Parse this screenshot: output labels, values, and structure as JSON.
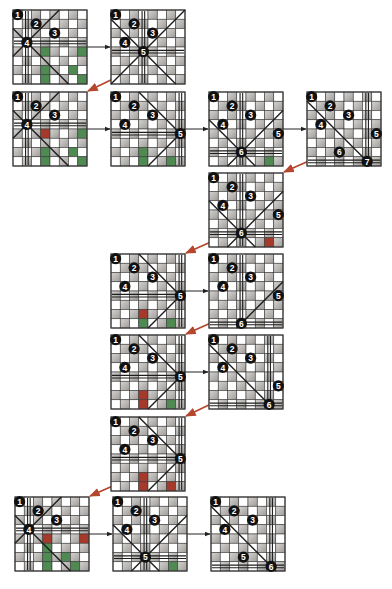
{
  "board_size": 8,
  "colors": {
    "dark_cell": "#a9a6a3",
    "dark_cell_light": "#d8d6d4",
    "light_cell": "#ffffff",
    "grid_line": "#3a3a3a",
    "attack_line": "#1e1e1e",
    "queen_fill": "#111111",
    "queen_text": "#ffffff",
    "conflict_green": "#4e8a52",
    "conflict_red": "#a63a2a",
    "forward_arrow": "#222222",
    "backtrack_arrow": "#b4472e"
  },
  "boards": [
    {
      "id": "b1",
      "queens": [
        {
          "label": "1",
          "row": 0,
          "col": 0
        },
        {
          "label": "2",
          "row": 1,
          "col": 2
        },
        {
          "label": "3",
          "row": 2,
          "col": 4
        },
        {
          "label": "4",
          "row": 3,
          "col": 1
        }
      ],
      "attack": [
        {
          "type": "v",
          "col": 1
        },
        {
          "type": "h",
          "row": 3
        },
        {
          "type": "d",
          "row": 3,
          "col": 1
        },
        {
          "type": "a",
          "row": 3,
          "col": 1
        }
      ],
      "green": [
        [
          4,
          3
        ],
        [
          4,
          7
        ],
        [
          6,
          3
        ],
        [
          6,
          6
        ],
        [
          7,
          3
        ],
        [
          7,
          7
        ]
      ],
      "red": []
    },
    {
      "id": "b2",
      "queens": [
        {
          "label": "1",
          "row": 0,
          "col": 0
        },
        {
          "label": "2",
          "row": 1,
          "col": 2
        },
        {
          "label": "3",
          "row": 2,
          "col": 4
        },
        {
          "label": "4",
          "row": 3,
          "col": 1
        },
        {
          "label": "5",
          "row": 4,
          "col": 3
        }
      ],
      "attack": [
        {
          "type": "v",
          "col": 3
        },
        {
          "type": "h",
          "row": 4
        },
        {
          "type": "d",
          "row": 4,
          "col": 3
        },
        {
          "type": "a",
          "row": 4,
          "col": 3
        }
      ],
      "green": [],
      "red": []
    },
    {
      "id": "b3",
      "queens": [
        {
          "label": "1",
          "row": 0,
          "col": 0
        },
        {
          "label": "2",
          "row": 1,
          "col": 2
        },
        {
          "label": "3",
          "row": 2,
          "col": 4
        },
        {
          "label": "4",
          "row": 3,
          "col": 1
        }
      ],
      "attack": [
        {
          "type": "v",
          "col": 1
        },
        {
          "type": "h",
          "row": 3
        },
        {
          "type": "d",
          "row": 3,
          "col": 1
        },
        {
          "type": "a",
          "row": 3,
          "col": 1
        }
      ],
      "green": [
        [
          4,
          7
        ],
        [
          6,
          3
        ],
        [
          6,
          6
        ],
        [
          7,
          3
        ],
        [
          7,
          7
        ]
      ],
      "red": [
        [
          4,
          3
        ]
      ]
    },
    {
      "id": "b4",
      "queens": [
        {
          "label": "1",
          "row": 0,
          "col": 0
        },
        {
          "label": "2",
          "row": 1,
          "col": 2
        },
        {
          "label": "3",
          "row": 2,
          "col": 4
        },
        {
          "label": "4",
          "row": 3,
          "col": 1
        },
        {
          "label": "5",
          "row": 4,
          "col": 7
        }
      ],
      "attack": [
        {
          "type": "v",
          "col": 7
        },
        {
          "type": "h",
          "row": 4
        },
        {
          "type": "d",
          "row": 4,
          "col": 7
        },
        {
          "type": "a",
          "row": 4,
          "col": 7
        }
      ],
      "green": [
        [
          6,
          3
        ],
        [
          7,
          3
        ],
        [
          7,
          6
        ]
      ],
      "red": []
    },
    {
      "id": "b5",
      "queens": [
        {
          "label": "1",
          "row": 0,
          "col": 0
        },
        {
          "label": "2",
          "row": 1,
          "col": 2
        },
        {
          "label": "3",
          "row": 2,
          "col": 4
        },
        {
          "label": "4",
          "row": 3,
          "col": 1
        },
        {
          "label": "5",
          "row": 4,
          "col": 7
        },
        {
          "label": "6",
          "row": 6,
          "col": 3
        }
      ],
      "attack": [
        {
          "type": "v",
          "col": 3
        },
        {
          "type": "h",
          "row": 6
        },
        {
          "type": "d",
          "row": 6,
          "col": 3
        },
        {
          "type": "a",
          "row": 6,
          "col": 3
        }
      ],
      "green": [
        [
          7,
          6
        ]
      ],
      "red": []
    },
    {
      "id": "b6",
      "queens": [
        {
          "label": "1",
          "row": 0,
          "col": 0
        },
        {
          "label": "2",
          "row": 1,
          "col": 2
        },
        {
          "label": "3",
          "row": 2,
          "col": 4
        },
        {
          "label": "4",
          "row": 3,
          "col": 1
        },
        {
          "label": "5",
          "row": 4,
          "col": 7
        },
        {
          "label": "6",
          "row": 6,
          "col": 3
        },
        {
          "label": "7",
          "row": 7,
          "col": 6
        }
      ],
      "attack": [
        {
          "type": "v",
          "col": 6
        },
        {
          "type": "h",
          "row": 7
        },
        {
          "type": "d",
          "row": 7,
          "col": 6
        }
      ],
      "green": [],
      "red": []
    },
    {
      "id": "b7",
      "queens": [
        {
          "label": "1",
          "row": 0,
          "col": 0
        },
        {
          "label": "2",
          "row": 1,
          "col": 2
        },
        {
          "label": "3",
          "row": 2,
          "col": 4
        },
        {
          "label": "4",
          "row": 3,
          "col": 1
        },
        {
          "label": "5",
          "row": 4,
          "col": 7
        },
        {
          "label": "6",
          "row": 6,
          "col": 3
        }
      ],
      "attack": [
        {
          "type": "v",
          "col": 3
        },
        {
          "type": "h",
          "row": 6
        },
        {
          "type": "d",
          "row": 6,
          "col": 3
        },
        {
          "type": "a",
          "row": 6,
          "col": 3
        }
      ],
      "green": [],
      "red": [
        [
          7,
          6
        ]
      ]
    },
    {
      "id": "b8",
      "queens": [
        {
          "label": "1",
          "row": 0,
          "col": 0
        },
        {
          "label": "2",
          "row": 1,
          "col": 2
        },
        {
          "label": "3",
          "row": 2,
          "col": 4
        },
        {
          "label": "4",
          "row": 3,
          "col": 1
        },
        {
          "label": "5",
          "row": 4,
          "col": 7
        }
      ],
      "attack": [
        {
          "type": "v",
          "col": 7
        },
        {
          "type": "h",
          "row": 4
        },
        {
          "type": "d",
          "row": 4,
          "col": 7
        },
        {
          "type": "a",
          "row": 4,
          "col": 7
        }
      ],
      "green": [
        [
          7,
          3
        ],
        [
          7,
          6
        ]
      ],
      "red": [
        [
          6,
          3
        ]
      ]
    },
    {
      "id": "b9",
      "queens": [
        {
          "label": "1",
          "row": 0,
          "col": 0
        },
        {
          "label": "2",
          "row": 1,
          "col": 2
        },
        {
          "label": "3",
          "row": 2,
          "col": 4
        },
        {
          "label": "4",
          "row": 3,
          "col": 1
        },
        {
          "label": "5",
          "row": 4,
          "col": 7
        },
        {
          "label": "6",
          "row": 7,
          "col": 3
        }
      ],
      "attack": [
        {
          "type": "v",
          "col": 3
        },
        {
          "type": "h",
          "row": 7
        },
        {
          "type": "a",
          "row": 7,
          "col": 3
        }
      ],
      "green": [],
      "red": []
    },
    {
      "id": "b10",
      "queens": [
        {
          "label": "1",
          "row": 0,
          "col": 0
        },
        {
          "label": "2",
          "row": 1,
          "col": 2
        },
        {
          "label": "3",
          "row": 2,
          "col": 4
        },
        {
          "label": "4",
          "row": 3,
          "col": 1
        },
        {
          "label": "5",
          "row": 4,
          "col": 7
        }
      ],
      "attack": [
        {
          "type": "v",
          "col": 7
        },
        {
          "type": "h",
          "row": 4
        },
        {
          "type": "d",
          "row": 4,
          "col": 7
        },
        {
          "type": "a",
          "row": 4,
          "col": 7
        }
      ],
      "green": [
        [
          7,
          6
        ]
      ],
      "red": [
        [
          6,
          3
        ],
        [
          7,
          3
        ]
      ]
    },
    {
      "id": "b11",
      "queens": [
        {
          "label": "1",
          "row": 0,
          "col": 0
        },
        {
          "label": "2",
          "row": 1,
          "col": 2
        },
        {
          "label": "3",
          "row": 2,
          "col": 4
        },
        {
          "label": "4",
          "row": 3,
          "col": 1
        },
        {
          "label": "5",
          "row": 5,
          "col": 7
        },
        {
          "label": "6",
          "row": 7,
          "col": 6
        }
      ],
      "attack": [
        {
          "type": "v",
          "col": 6
        },
        {
          "type": "h",
          "row": 7
        },
        {
          "type": "d",
          "row": 7,
          "col": 6
        }
      ],
      "green": [],
      "red": []
    },
    {
      "id": "b12",
      "queens": [
        {
          "label": "1",
          "row": 0,
          "col": 0
        },
        {
          "label": "2",
          "row": 1,
          "col": 2
        },
        {
          "label": "3",
          "row": 2,
          "col": 4
        },
        {
          "label": "4",
          "row": 3,
          "col": 1
        },
        {
          "label": "5",
          "row": 4,
          "col": 7
        }
      ],
      "attack": [
        {
          "type": "v",
          "col": 7
        },
        {
          "type": "h",
          "row": 4
        },
        {
          "type": "d",
          "row": 4,
          "col": 7
        },
        {
          "type": "a",
          "row": 4,
          "col": 7
        }
      ],
      "green": [],
      "red": [
        [
          6,
          3
        ],
        [
          7,
          3
        ],
        [
          7,
          6
        ]
      ]
    },
    {
      "id": "b13",
      "queens": [
        {
          "label": "1",
          "row": 0,
          "col": 0
        },
        {
          "label": "2",
          "row": 1,
          "col": 2
        },
        {
          "label": "3",
          "row": 2,
          "col": 4
        },
        {
          "label": "4",
          "row": 3,
          "col": 1
        }
      ],
      "attack": [
        {
          "type": "v",
          "col": 1
        },
        {
          "type": "h",
          "row": 3
        },
        {
          "type": "d",
          "row": 3,
          "col": 1
        },
        {
          "type": "a",
          "row": 3,
          "col": 1
        }
      ],
      "green": [
        [
          5,
          3
        ],
        [
          6,
          3
        ],
        [
          6,
          5
        ],
        [
          7,
          3
        ],
        [
          7,
          6
        ]
      ],
      "red": [
        [
          4,
          3
        ],
        [
          4,
          7
        ]
      ]
    },
    {
      "id": "b14",
      "queens": [
        {
          "label": "1",
          "row": 0,
          "col": 0
        },
        {
          "label": "2",
          "row": 1,
          "col": 2
        },
        {
          "label": "3",
          "row": 2,
          "col": 4
        },
        {
          "label": "4",
          "row": 3,
          "col": 1
        },
        {
          "label": "5",
          "row": 6,
          "col": 3
        }
      ],
      "attack": [
        {
          "type": "v",
          "col": 3
        },
        {
          "type": "h",
          "row": 6
        },
        {
          "type": "d",
          "row": 6,
          "col": 3
        },
        {
          "type": "a",
          "row": 6,
          "col": 3
        }
      ],
      "green": [
        [
          7,
          6
        ]
      ],
      "red": []
    },
    {
      "id": "b15",
      "queens": [
        {
          "label": "1",
          "row": 0,
          "col": 0
        },
        {
          "label": "2",
          "row": 1,
          "col": 2
        },
        {
          "label": "3",
          "row": 2,
          "col": 4
        },
        {
          "label": "4",
          "row": 3,
          "col": 1
        },
        {
          "label": "5",
          "row": 6,
          "col": 3
        },
        {
          "label": "6",
          "row": 7,
          "col": 6
        }
      ],
      "attack": [
        {
          "type": "v",
          "col": 6
        },
        {
          "type": "h",
          "row": 7
        },
        {
          "type": "d",
          "row": 7,
          "col": 6
        }
      ],
      "green": [],
      "red": []
    }
  ],
  "arrows": [
    {
      "from": "b1",
      "to": "b2",
      "kind": "forward"
    },
    {
      "from": "b2",
      "to": "b3",
      "kind": "backtrack"
    },
    {
      "from": "b3",
      "to": "b4",
      "kind": "forward"
    },
    {
      "from": "b4",
      "to": "b5",
      "kind": "forward"
    },
    {
      "from": "b5",
      "to": "b6",
      "kind": "forward"
    },
    {
      "from": "b6",
      "to": "b7",
      "kind": "backtrack"
    },
    {
      "from": "b7",
      "to": "b8",
      "kind": "backtrack"
    },
    {
      "from": "b8",
      "to": "b9",
      "kind": "forward"
    },
    {
      "from": "b9",
      "to": "b10",
      "kind": "backtrack"
    },
    {
      "from": "b10",
      "to": "b11",
      "kind": "forward"
    },
    {
      "from": "b11",
      "to": "b12",
      "kind": "backtrack"
    },
    {
      "from": "b12",
      "to": "b13",
      "kind": "backtrack"
    },
    {
      "from": "b13",
      "to": "b14",
      "kind": "forward"
    },
    {
      "from": "b14",
      "to": "b15",
      "kind": "forward"
    }
  ]
}
